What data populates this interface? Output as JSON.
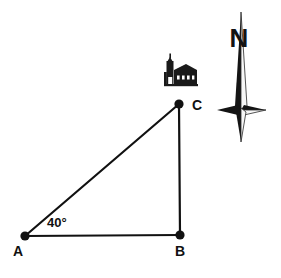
{
  "canvas": {
    "width": 281,
    "height": 278,
    "background": "#ffffff"
  },
  "diagram": {
    "stroke_color": "#111111",
    "stroke_width": 2,
    "vertex_dot_radius": 4.5,
    "vertices": [
      {
        "id": "A",
        "label": "A",
        "x": 25,
        "y": 236,
        "label_x": 18,
        "label_y": 256
      },
      {
        "id": "B",
        "label": "B",
        "x": 180,
        "y": 235,
        "label_x": 180,
        "label_y": 256
      },
      {
        "id": "C",
        "label": "C",
        "x": 179,
        "y": 104,
        "label_x": 192,
        "label_y": 109
      }
    ],
    "edges": [
      {
        "from": "A",
        "to": "C",
        "name": "hypotenuse-ac"
      },
      {
        "from": "A",
        "to": "B",
        "name": "base-ab"
      },
      {
        "from": "B",
        "to": "C",
        "name": "vertical-bc"
      }
    ],
    "angle": {
      "at_vertex": "A",
      "value": "40°",
      "label_x": 60,
      "label_y": 227
    }
  },
  "church": {
    "name": "church-icon",
    "label": "church",
    "x": 163,
    "y": 57,
    "width": 34,
    "height": 29,
    "color": "#1a1a1a"
  },
  "compass": {
    "name": "north-arrow",
    "letter": "N",
    "letter_x": 239,
    "letter_y": 45,
    "center_x": 241,
    "top_y": 12,
    "bottom_y": 142,
    "left_x": 217,
    "right_x": 266,
    "wing_y": 110,
    "dark_color": "#141414",
    "light_color": "#f3f3f3",
    "outline_color": "#2a2a2a"
  }
}
